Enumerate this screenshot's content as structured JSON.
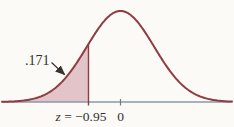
{
  "chart_data": {
    "type": "area",
    "title": "",
    "distribution": "standard normal curve",
    "curve": {
      "mean_z": 0,
      "sigma_z": 1
    },
    "shaded": {
      "region": "left tail",
      "to_z": -0.95,
      "area": 0.171,
      "label": ".171"
    },
    "ticks": [
      {
        "z": -0.95,
        "label_var": "z",
        "label_rest": " = −0.95"
      },
      {
        "z": 0,
        "label": "0"
      }
    ],
    "axis": {
      "xlim_z": [
        -3.49,
        3.28
      ],
      "ylabel": "",
      "xlabel": "",
      "grid": false
    },
    "colors": {
      "curve": "#8e3d44",
      "fill": "#e3c5c9",
      "axis": "#8a99a6",
      "zero_tick": "#6e7d8a",
      "text": "#34302d",
      "arrow": "#3a3431",
      "background": "#fbfaf7"
    }
  }
}
